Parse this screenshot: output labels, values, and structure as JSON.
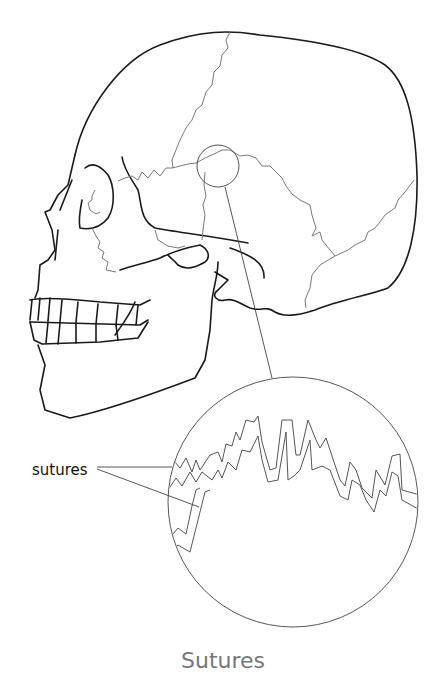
{
  "diagram": {
    "callout_label": "sutures",
    "caption": "Sutures",
    "colors": {
      "outline": "#1a1a1a",
      "suture_lines": "#7a7a7a",
      "caption": "#777777"
    }
  }
}
